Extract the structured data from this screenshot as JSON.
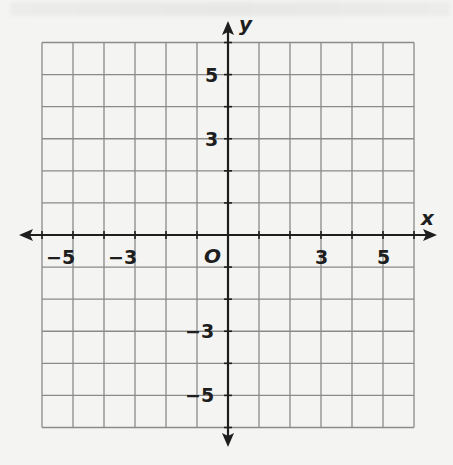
{
  "diagram": {
    "type": "coordinate-plane",
    "x_axis_label": "x",
    "y_axis_label": "y",
    "origin_label": "O",
    "x_range": [
      -6,
      6
    ],
    "y_range": [
      -6,
      6
    ],
    "grid_step": 1,
    "x_tick_labels": [
      {
        "value": -5,
        "text": "−5"
      },
      {
        "value": -3,
        "text": "−3"
      },
      {
        "value": 3,
        "text": "3"
      },
      {
        "value": 5,
        "text": "5"
      }
    ],
    "y_tick_labels": [
      {
        "value": 5,
        "text": "5"
      },
      {
        "value": 3,
        "text": "3"
      },
      {
        "value": -3,
        "text": "−3"
      },
      {
        "value": -5,
        "text": "−5"
      }
    ],
    "colors": {
      "background": "#f4f4f2",
      "grid": "#8a8a8a",
      "axis": "#1e1e1e"
    }
  }
}
